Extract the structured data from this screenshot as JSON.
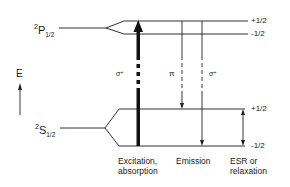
{
  "diagram": {
    "type": "energy-level-diagram",
    "axis": {
      "label": "E",
      "direction": "up"
    },
    "levels": [
      {
        "term": "P",
        "multiplicity": "2",
        "j": "1/2",
        "sublevels": [
          {
            "mj": "+1/2"
          },
          {
            "mj": "-1/2"
          }
        ]
      },
      {
        "term": "S",
        "multiplicity": "2",
        "j": "1/2",
        "sublevels": [
          {
            "mj": "+1/2"
          },
          {
            "mj": "-1/2"
          }
        ]
      }
    ],
    "transitions": [
      {
        "name": "excitation",
        "polarization": "σ⁺",
        "from": "²S½ -1/2",
        "to": "²P½ +1/2"
      },
      {
        "name": "emission-pi",
        "polarization": "π",
        "from": "²P½ +1/2",
        "to": "²S½ +1/2"
      },
      {
        "name": "emission-sigma",
        "polarization": "σ⁺",
        "from": "²P½ +1/2",
        "to": "²S½ -1/2"
      },
      {
        "name": "esr",
        "polarization": "",
        "from": "²S½ +1/2",
        "to": "²S½ -1/2"
      }
    ],
    "labels": {
      "p_mult": "2",
      "p_letter": "P",
      "p_j": "1/2",
      "s_mult": "2",
      "s_letter": "S",
      "s_j": "1/2",
      "p_plus": "+1/2",
      "p_minus": "-1/2",
      "s_plus": "+1/2",
      "s_minus": "-1/2",
      "energy": "E",
      "sigma_plus_left": "σ⁺",
      "pi": "π",
      "sigma_plus_right": "σ⁺",
      "col1_line1": "Excitation,",
      "col1_line2": "absorption",
      "col2_line1": "Emission",
      "col3_line1": "ESR or",
      "col3_line2": "relaxation"
    },
    "colors": {
      "line": "#1a1a1a",
      "background": "#ffffff"
    }
  }
}
